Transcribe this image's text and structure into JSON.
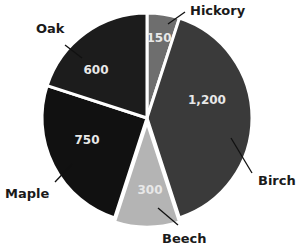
{
  "chart_data": {
    "type": "pie",
    "title": "",
    "categories": [
      "Hickory",
      "Birch",
      "Beech",
      "Maple",
      "Oak"
    ],
    "values": [
      150,
      1200,
      300,
      750,
      600
    ],
    "value_labels": [
      "150",
      "1,200",
      "300",
      "750",
      "600"
    ],
    "colors": [
      "#6e6e6e",
      "#3a3a3a",
      "#b4b4b4",
      "#111111",
      "#1c1c1c"
    ],
    "start_angle_deg": 0,
    "direction": "clockwise",
    "legend": "none",
    "label_style": "callout lines with category names outside, values inside slices"
  },
  "layout": {
    "center": [
      147,
      118
    ],
    "radius": 105,
    "gap_color": "#ffffff",
    "explode": [
      0,
      0,
      4,
      0,
      0
    ],
    "value_pos": [
      [
        159,
        38
      ],
      [
        207,
        100
      ],
      [
        150,
        190
      ],
      [
        87,
        140
      ],
      [
        96,
        70
      ]
    ],
    "callouts": [
      {
        "from": [
          168,
          24
        ],
        "to": [
          185,
          12
        ],
        "label": [
          190,
          15
        ],
        "anchor": "start"
      },
      {
        "from": [
          231,
          138
        ],
        "to": [
          252,
          173
        ],
        "label": [
          258,
          185
        ],
        "anchor": "start"
      },
      {
        "from": [
          158,
          208
        ],
        "to": [
          178,
          225
        ],
        "label": [
          162,
          243
        ],
        "anchor": "start"
      },
      {
        "from": [
          73,
          163
        ],
        "to": [
          55,
          182
        ],
        "label": [
          5,
          198
        ],
        "anchor": "start"
      },
      {
        "from": [
          82,
          58
        ],
        "to": [
          65,
          45
        ],
        "label": [
          36,
          33
        ],
        "anchor": "start"
      }
    ]
  }
}
